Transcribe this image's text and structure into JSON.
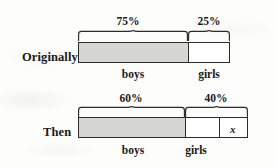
{
  "figure": {
    "type": "bar-model-diagram",
    "rows": [
      {
        "id": "originally",
        "label": "Originally",
        "bar": {
          "x": 78,
          "y": 42,
          "width": 152,
          "height": 21
        },
        "segments": [
          {
            "id": "boys",
            "label": "boys",
            "percent_label": "75%",
            "percent": 75,
            "fill": "shaded",
            "x": 78,
            "width": 110
          },
          {
            "id": "girls",
            "label": "girls",
            "percent_label": "25%",
            "percent": 25,
            "fill": "white",
            "x": 188,
            "width": 42
          }
        ],
        "sub_box": null
      },
      {
        "id": "then",
        "label": "Then",
        "bar": {
          "x": 78,
          "y": 117,
          "width": 170,
          "height": 21
        },
        "segments": [
          {
            "id": "boys",
            "label": "boys",
            "percent_label": "60%",
            "percent": 60,
            "fill": "shaded",
            "x": 78,
            "width": 107
          },
          {
            "id": "girls",
            "label": "girls",
            "percent_label": "40%",
            "percent": 40,
            "fill": "white",
            "x": 185,
            "width": 63
          }
        ],
        "sub_box": {
          "id": "x-box",
          "label": "x",
          "x": 219,
          "width": 29
        }
      }
    ],
    "colors": {
      "shaded_fill": "#d6d6d2",
      "white_fill": "#ffffff",
      "stroke": "#2b2b2b",
      "text": "#1a1a1a",
      "background": "#fdfdfc"
    }
  }
}
